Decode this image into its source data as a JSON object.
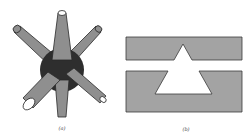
{
  "figure": {
    "panels": [
      {
        "id": "a",
        "caption": "(a)",
        "description": "3D node with six cylindrical arms radiating from a dark spherical center"
      },
      {
        "id": "b",
        "caption": "(b)",
        "description": "Two gray slabs with a triangular cutout spanning the gap between them"
      }
    ],
    "colors": {
      "arm_fill": "#8f8f8f",
      "arm_stroke": "#2a2a2a",
      "center_fill": "#2e2e2e",
      "slab_fill": "#a3a3a3",
      "slab_stroke": "#3a3a3a",
      "background": "#ffffff"
    }
  }
}
